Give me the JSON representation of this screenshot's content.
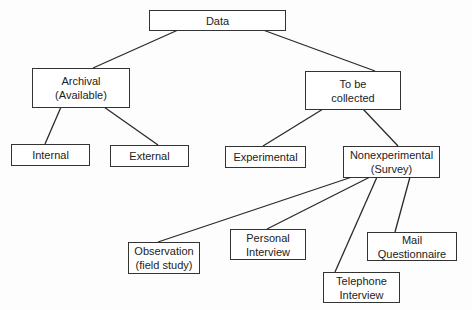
{
  "diagram": {
    "type": "tree",
    "nodes": {
      "data": {
        "label": "Data"
      },
      "archival": {
        "label": "Archival\n(Available)"
      },
      "to_be_collected": {
        "label": "To be\ncollected"
      },
      "internal": {
        "label": "Internal"
      },
      "external": {
        "label": "External"
      },
      "experimental": {
        "label": "Experimental"
      },
      "nonexperimental": {
        "label": "Nonexperimental\n(Survey)"
      },
      "observation": {
        "label": "Observation\n(field study)"
      },
      "personal_interview": {
        "label": "Personal\nInterview"
      },
      "telephone_interview": {
        "label": "Telephone\nInterview"
      },
      "mail_questionnaire": {
        "label": "Mail\nQuestionnaire"
      }
    },
    "edges": [
      [
        "data",
        "archival"
      ],
      [
        "data",
        "to_be_collected"
      ],
      [
        "archival",
        "internal"
      ],
      [
        "archival",
        "external"
      ],
      [
        "to_be_collected",
        "experimental"
      ],
      [
        "to_be_collected",
        "nonexperimental"
      ],
      [
        "nonexperimental",
        "observation"
      ],
      [
        "nonexperimental",
        "personal_interview"
      ],
      [
        "nonexperimental",
        "telephone_interview"
      ],
      [
        "nonexperimental",
        "mail_questionnaire"
      ]
    ]
  }
}
